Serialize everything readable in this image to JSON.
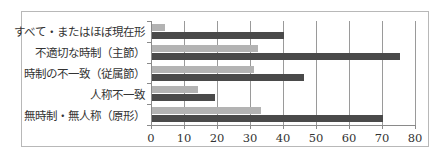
{
  "chart_data": {
    "type": "bar",
    "orientation": "horizontal",
    "title": "",
    "xlabel": "",
    "ylabel": "",
    "xlim": [
      0,
      80
    ],
    "x_ticks": [
      0,
      10,
      20,
      30,
      40,
      50,
      60,
      70,
      80
    ],
    "grid": true,
    "legend": null,
    "categories": [
      "すべて・またはほぼ現在形",
      "不適切な時制（主節）",
      "時制の不一致（従属節）",
      "人称不一致",
      "無時制・無人称（原形）"
    ],
    "series": [
      {
        "name": "series-light",
        "color": "#b3b3b3",
        "values": [
          4,
          32,
          31,
          14,
          33
        ]
      },
      {
        "name": "series-dark",
        "color": "#4a4a4a",
        "values": [
          40,
          75,
          46,
          19,
          70
        ]
      }
    ]
  },
  "labels": {
    "cat0": "すべて・またはほぼ現在形",
    "cat1": "不適切な時制（主節）",
    "cat2": "時制の不一致（従属節）",
    "cat3": "人称不一致",
    "cat4": "無時制・無人称（原形）",
    "x0": "0",
    "x1": "10",
    "x2": "20",
    "x3": "30",
    "x4": "40",
    "x5": "50",
    "x6": "60",
    "x7": "70",
    "x8": "80"
  }
}
